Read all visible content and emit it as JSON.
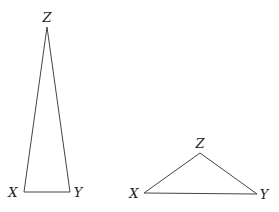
{
  "diagram": {
    "triangles": [
      {
        "name": "tall-triangle",
        "vertices": {
          "Z": {
            "label": "Z",
            "x": 47,
            "y": 27,
            "lx": 47,
            "ly": 22
          },
          "X": {
            "label": "X",
            "x": 24,
            "y": 192,
            "lx": 13,
            "ly": 197
          },
          "Y": {
            "label": "Y",
            "x": 70,
            "y": 192,
            "lx": 78,
            "ly": 197
          }
        }
      },
      {
        "name": "wide-triangle",
        "vertices": {
          "Z": {
            "label": "Z",
            "x": 200,
            "y": 153,
            "lx": 200,
            "ly": 148
          },
          "X": {
            "label": "X",
            "x": 144,
            "y": 193,
            "lx": 134,
            "ly": 198
          },
          "Y": {
            "label": "Y",
            "x": 257,
            "y": 194,
            "lx": 264,
            "ly": 199
          }
        }
      }
    ]
  }
}
